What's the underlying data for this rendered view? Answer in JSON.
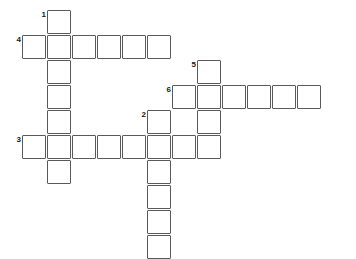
{
  "puzzle": {
    "type": "crossword-grid",
    "title": "",
    "width": 356,
    "height": 259,
    "cell_size": 24,
    "cell_pitch": 25,
    "origin_x": 22,
    "origin_y": 10,
    "cell_fill": "#ffffff",
    "cell_border": "#5a5a5a",
    "background": "#ffffff",
    "number_color": "#1a1a1a",
    "entries": [
      {
        "number": "1",
        "direction": "down",
        "col": 1,
        "row": 0,
        "length": 7,
        "letters": [
          "",
          "",
          "",
          "",
          "",
          "",
          ""
        ]
      },
      {
        "number": "4",
        "direction": "across",
        "col": 0,
        "row": 1,
        "length": 6,
        "letters": [
          "",
          "",
          "",
          "",
          "",
          ""
        ]
      },
      {
        "number": "5",
        "direction": "down",
        "col": 7,
        "row": 2,
        "length": 4,
        "letters": [
          "",
          "",
          "",
          ""
        ]
      },
      {
        "number": "6",
        "direction": "across",
        "col": 6,
        "row": 3,
        "length": 6,
        "letters": [
          "",
          "",
          "",
          "",
          "",
          ""
        ]
      },
      {
        "number": "2",
        "direction": "down",
        "col": 5,
        "row": 4,
        "length": 6,
        "letters": [
          "",
          "",
          "",
          "",
          "",
          ""
        ]
      },
      {
        "number": "3",
        "direction": "across",
        "col": 0,
        "row": 5,
        "length": 8,
        "letters": [
          "",
          "",
          "",
          "",
          "",
          "",
          "",
          ""
        ]
      }
    ],
    "cells": [
      {
        "col": 1,
        "row": 0,
        "number": "1",
        "letter": ""
      },
      {
        "col": 0,
        "row": 1,
        "number": "4",
        "letter": ""
      },
      {
        "col": 1,
        "row": 1,
        "number": "",
        "letter": ""
      },
      {
        "col": 2,
        "row": 1,
        "number": "",
        "letter": ""
      },
      {
        "col": 3,
        "row": 1,
        "number": "",
        "letter": ""
      },
      {
        "col": 4,
        "row": 1,
        "number": "",
        "letter": ""
      },
      {
        "col": 5,
        "row": 1,
        "number": "",
        "letter": ""
      },
      {
        "col": 1,
        "row": 2,
        "number": "",
        "letter": ""
      },
      {
        "col": 7,
        "row": 2,
        "number": "5",
        "letter": ""
      },
      {
        "col": 1,
        "row": 3,
        "number": "",
        "letter": ""
      },
      {
        "col": 6,
        "row": 3,
        "number": "6",
        "letter": ""
      },
      {
        "col": 7,
        "row": 3,
        "number": "",
        "letter": ""
      },
      {
        "col": 8,
        "row": 3,
        "number": "",
        "letter": ""
      },
      {
        "col": 9,
        "row": 3,
        "number": "",
        "letter": ""
      },
      {
        "col": 10,
        "row": 3,
        "number": "",
        "letter": ""
      },
      {
        "col": 11,
        "row": 3,
        "number": "",
        "letter": ""
      },
      {
        "col": 1,
        "row": 4,
        "number": "",
        "letter": ""
      },
      {
        "col": 5,
        "row": 4,
        "number": "2",
        "letter": ""
      },
      {
        "col": 7,
        "row": 4,
        "number": "",
        "letter": ""
      },
      {
        "col": 0,
        "row": 5,
        "number": "3",
        "letter": ""
      },
      {
        "col": 1,
        "row": 5,
        "number": "",
        "letter": ""
      },
      {
        "col": 2,
        "row": 5,
        "number": "",
        "letter": ""
      },
      {
        "col": 3,
        "row": 5,
        "number": "",
        "letter": ""
      },
      {
        "col": 4,
        "row": 5,
        "number": "",
        "letter": ""
      },
      {
        "col": 5,
        "row": 5,
        "number": "",
        "letter": ""
      },
      {
        "col": 6,
        "row": 5,
        "number": "",
        "letter": ""
      },
      {
        "col": 7,
        "row": 5,
        "number": "",
        "letter": ""
      },
      {
        "col": 1,
        "row": 6,
        "number": "",
        "letter": ""
      },
      {
        "col": 5,
        "row": 6,
        "number": "",
        "letter": ""
      },
      {
        "col": 5,
        "row": 7,
        "number": "",
        "letter": ""
      },
      {
        "col": 5,
        "row": 8,
        "number": "",
        "letter": ""
      },
      {
        "col": 5,
        "row": 9,
        "number": "",
        "letter": ""
      }
    ]
  }
}
